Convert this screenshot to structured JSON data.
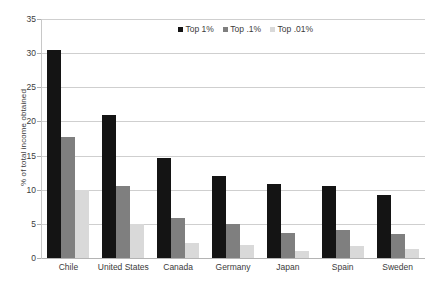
{
  "chart_data": {
    "type": "bar",
    "title": "",
    "xlabel": "",
    "ylabel": "% of total income obtained",
    "ylim": [
      0,
      35
    ],
    "yticks": [
      0,
      5,
      10,
      15,
      20,
      25,
      30,
      35
    ],
    "grid": true,
    "legend_position": "top-center",
    "categories": [
      "Chile",
      "United States",
      "Canada",
      "Germany",
      "Japan",
      "Spain",
      "Sweden"
    ],
    "series": [
      {
        "name": "Top 1%",
        "color": "#141414",
        "values": [
          30.5,
          21.0,
          14.7,
          12.0,
          10.9,
          10.5,
          9.2
        ]
      },
      {
        "name": "Top .1%",
        "color": "#7f7f7f",
        "values": [
          17.7,
          10.5,
          5.9,
          5.0,
          3.6,
          4.1,
          3.5
        ]
      },
      {
        "name": "Top .01%",
        "color": "#d9d9d9",
        "values": [
          10.0,
          5.0,
          2.2,
          1.9,
          1.1,
          1.7,
          1.3
        ]
      }
    ]
  }
}
